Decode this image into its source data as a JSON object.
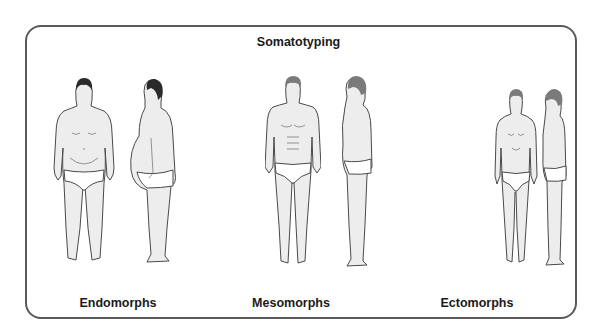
{
  "diagram": {
    "title": "Somatotyping",
    "categories": [
      {
        "label": "Endomorphs",
        "views": [
          "front",
          "side"
        ],
        "build": "rounded, heavy"
      },
      {
        "label": "Mesomorphs",
        "views": [
          "front",
          "side"
        ],
        "build": "muscular, medium"
      },
      {
        "label": "Ectomorphs",
        "views": [
          "front",
          "side"
        ],
        "build": "lean, thin"
      }
    ]
  },
  "colors": {
    "frame_border": "#5a5a5a",
    "figure_fill": "#ededed",
    "outline": "#4a4a4a",
    "text": "#1a1a1a"
  }
}
